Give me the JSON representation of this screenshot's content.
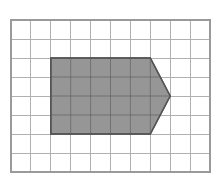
{
  "figure": {
    "title": "Shaded pentagon arrow on square grid",
    "background_color": "#ffffff"
  },
  "grid": {
    "columns": 10,
    "rows": 8,
    "origin_x": 11,
    "origin_y": 20,
    "cell_width": 19.9,
    "cell_height": 19.0,
    "line_color": "#b0b0b0",
    "line_width": 1,
    "border_color": "#9a9a9a",
    "border_width": 1.4
  },
  "shape": {
    "name": "pentagon-arrow",
    "fill_color": "#969696",
    "stroke_color": "#555555",
    "stroke_width": 1.4,
    "body": {
      "col_start": 2,
      "col_end": 7,
      "row_start": 2,
      "row_end": 6
    },
    "tip": {
      "apex_col": 8,
      "apex_row": 4
    },
    "vertices_grid": [
      [
        2,
        2
      ],
      [
        7,
        2
      ],
      [
        8,
        4
      ],
      [
        7,
        6
      ],
      [
        2,
        6
      ]
    ],
    "vertices_px": [
      [
        50.8,
        58.0
      ],
      [
        150.3,
        58.0
      ],
      [
        170.2,
        96.0
      ],
      [
        150.3,
        134.0
      ],
      [
        50.8,
        134.0
      ]
    ]
  }
}
